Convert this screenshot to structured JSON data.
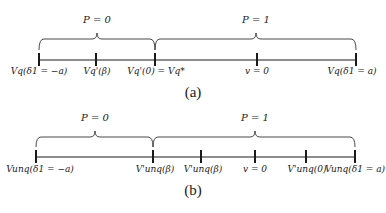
{
  "panels": [
    {
      "caption": "(a)",
      "regions": [
        {
          "label": "P = 0"
        },
        {
          "label": "P = 1"
        }
      ],
      "ticks": [
        {
          "label": "Vq(δ1 = −a)"
        },
        {
          "label": "Vq'(β)"
        },
        {
          "label": "Vq'(0) = Vq*"
        },
        {
          "label": "v = 0"
        },
        {
          "label": "Vq(δ1 = a)"
        }
      ]
    },
    {
      "caption": "(b)",
      "regions": [
        {
          "label": "P = 0"
        },
        {
          "label": "P = 1"
        }
      ],
      "ticks": [
        {
          "label": "Vunq(δ1 = −a)"
        },
        {
          "label": "V'unq(β)"
        },
        {
          "label": "V'unq(β)"
        },
        {
          "label": "v = 0"
        },
        {
          "label": "V'unq(0)"
        },
        {
          "label": "Vunq(δ1 = a)"
        }
      ]
    }
  ]
}
